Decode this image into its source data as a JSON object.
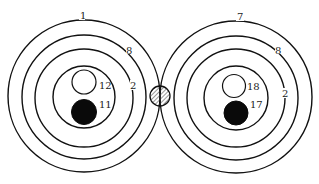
{
  "diagram": {
    "colors": {
      "stroke": "#111111",
      "filled": "#0a0a0a",
      "background": "#ffffff"
    },
    "left_system": {
      "center": [
        84,
        98
      ],
      "ring_labels": {
        "outer": "1",
        "second": "8",
        "third": "2"
      },
      "inner_bodies": [
        {
          "type": "open",
          "label": "12"
        },
        {
          "type": "filled",
          "label": "11"
        }
      ]
    },
    "right_system": {
      "center": [
        236,
        98
      ],
      "ring_labels": {
        "outer": "7",
        "second": "8",
        "third": "2"
      },
      "inner_bodies": [
        {
          "type": "open",
          "label": "18"
        },
        {
          "type": "filled",
          "label": "17"
        }
      ]
    },
    "junction": {
      "type": "hatched-circle"
    }
  }
}
